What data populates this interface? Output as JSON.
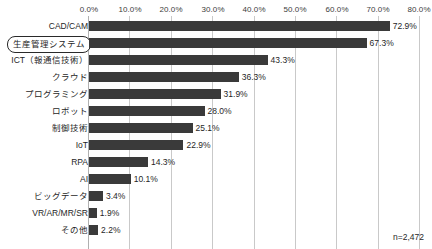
{
  "chart_data": {
    "type": "bar",
    "orientation": "horizontal",
    "title": "",
    "xlabel": "",
    "ylabel": "",
    "xlim": [
      0,
      80
    ],
    "xtick_labels": [
      "0.0%",
      "10.0%",
      "20.0%",
      "30.0%",
      "40.0%",
      "50.0%",
      "60.0%",
      "70.0%",
      "80.0%"
    ],
    "xticks": [
      0,
      10,
      20,
      30,
      40,
      50,
      60,
      70,
      80
    ],
    "grid": true,
    "legend": null,
    "bar_color": "#3a3a3a",
    "gridline_color": "#c9c9c9",
    "categories": [
      "CAD/CAM",
      "生産管理システム",
      "ICT（報通信技術）",
      "クラウド",
      "プログラミング",
      "ロボット",
      "制御技術",
      "IoT",
      "RPA",
      "AI",
      "ビッグデータ",
      "VR/AR/MR/SR",
      "その他"
    ],
    "values": [
      72.9,
      67.3,
      43.3,
      36.3,
      31.9,
      28.0,
      25.1,
      22.9,
      14.3,
      10.1,
      3.4,
      1.9,
      2.2
    ],
    "value_labels": [
      "72.9%",
      "67.3%",
      "43.3%",
      "36.3%",
      "31.9%",
      "28.0%",
      "25.1%",
      "22.9%",
      "14.3%",
      "10.1%",
      "3.4%",
      "1.9%",
      "2.2%"
    ],
    "highlighted_category": "生産管理システム",
    "annotation": "n=2,472"
  }
}
